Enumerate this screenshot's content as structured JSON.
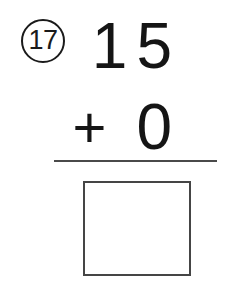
{
  "problem": {
    "number_label": "17",
    "first_addend": "15",
    "operator": "+",
    "second_addend": "0",
    "answer_value": "",
    "answer_placeholder": ""
  },
  "colors": {
    "ink": "#151515",
    "rule": "#4a4a4a",
    "box_border": "#454545",
    "page_background": "#ffffff"
  }
}
